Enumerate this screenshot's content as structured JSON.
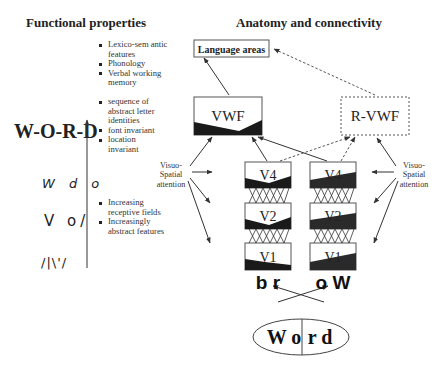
{
  "headings": {
    "functional": "Functional properties",
    "anatomy": "Anatomy and connectivity"
  },
  "left_column": {
    "word_levels": [
      {
        "label": "W-O-R-D",
        "style": "bold-assembled"
      },
      {
        "label": "W d o",
        "style": "italic-letters"
      },
      {
        "label": "V o/",
        "style": "letter-fragments"
      },
      {
        "label": "/|\\'/",
        "style": "oriented-bars"
      }
    ],
    "axis_arrow": "increasing-abstraction-arrow"
  },
  "bullet_groups": [
    {
      "items": [
        "Lexico-sem antic features",
        "Phonology",
        "Verbal working memory"
      ]
    },
    {
      "items": [
        "sequence of abstract letter identities",
        "font invariant",
        "location invariant"
      ]
    },
    {
      "items": [
        "Increasing receptive fields",
        "Increasingly abstract features"
      ]
    }
  ],
  "nodes": {
    "language_areas": "Language areas",
    "vwf": "VWF",
    "r_vwf": "R-VWF",
    "left_stack": [
      "V4",
      "V2",
      "V1"
    ],
    "right_stack": [
      "V4",
      "V2",
      "V1"
    ]
  },
  "attention_labels": {
    "left": [
      "Visuo-",
      "Spatial",
      "attention"
    ],
    "right": [
      "Visuo-",
      "Spatial",
      "attention"
    ]
  },
  "stimulus": {
    "left_half_letters": "b r",
    "right_half_letters": "o W",
    "word_left": "W o",
    "word_right": "r d",
    "word": "Word"
  },
  "colors": {
    "line": "#333333",
    "fill_dark": "#1a1a1a",
    "box_border": "#555555",
    "dashed": "#555555"
  }
}
